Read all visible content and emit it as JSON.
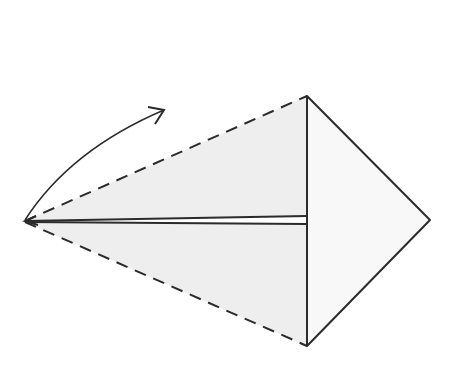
{
  "diagram": {
    "type": "origami-fold-step",
    "colors": {
      "paper": "#f0f0f0",
      "paper_light": "#f7f7f7",
      "line": "#2b2b2b",
      "background": "#ffffff"
    },
    "points": {
      "left": [
        25,
        221
      ],
      "top": [
        307,
        96
      ],
      "bottom": [
        307,
        346
      ],
      "right": [
        430,
        220
      ],
      "upper_flap_edge_y": 216,
      "lower_flap_edge_y": 224
    },
    "arrow": {
      "kind": "valley-fold-arrow",
      "start": [
        25,
        220
      ],
      "end": [
        164,
        110
      ]
    }
  }
}
